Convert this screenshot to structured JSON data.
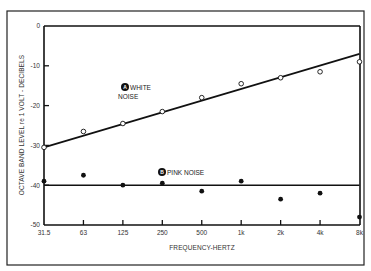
{
  "chart_data": {
    "type": "scatter",
    "title": "",
    "xlabel": "FREQUENCY-HERTZ",
    "ylabel": "OCTAVE BAND LEVEL re 1 VOLT - DECIBELS",
    "categories": [
      "31.5",
      "63",
      "125",
      "250",
      "500",
      "1k",
      "2k",
      "4k",
      "8k"
    ],
    "ylim": [
      -50,
      0
    ],
    "yticks": [
      0,
      -10,
      -20,
      -30,
      -40,
      -50
    ],
    "ytick_labels": [
      "0",
      "-10",
      "-20",
      "-30",
      "-40",
      "-50"
    ],
    "grid": false,
    "legend": "inline labels",
    "series": [
      {
        "name": "WHITE NOISE",
        "badge": "A",
        "marker": "open-circle",
        "values": [
          -30.5,
          -26.5,
          -24.5,
          -21.5,
          -18,
          -14.5,
          -13,
          -11.5,
          -9
        ],
        "trendline": {
          "start": -30.5,
          "end": -7
        }
      },
      {
        "name": "PINK NOISE",
        "badge": "B",
        "marker": "filled-circle",
        "values": [
          -39,
          -37.5,
          -40,
          -39.5,
          -41.5,
          -39,
          -43.5,
          -42,
          -48
        ],
        "trendline": {
          "start": -40,
          "end": -40
        }
      }
    ]
  },
  "labels": {
    "white_line1": "WHITE",
    "white_line2": "NOISE",
    "white_badge": "A",
    "pink": "PINK NOISE",
    "pink_badge": "B",
    "xlabel": "FREQUENCY-HERTZ",
    "ylabel": "OCTAVE BAND LEVEL re 1 VOLT - DECIBELS"
  },
  "colors": {
    "ink": "#1a1a1a",
    "background": "#ffffff"
  }
}
